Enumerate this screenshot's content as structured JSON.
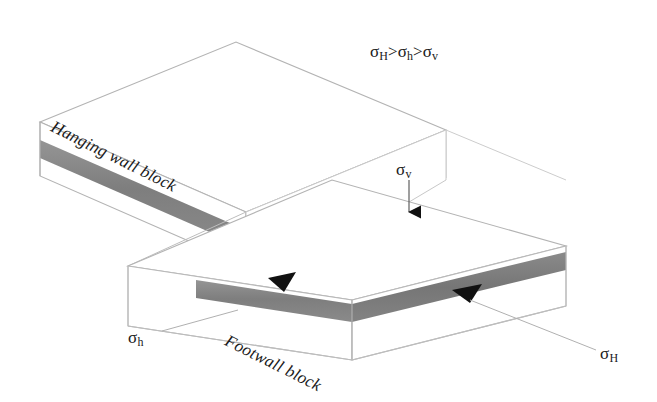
{
  "figure": {
    "type": "geological-block-diagram"
  },
  "labels": {
    "hanging_wall": "Hanging wall block",
    "footwall": "Footwall block",
    "stress_inequality": {
      "sigma1": "σ",
      "sigma1_sub": "H",
      "op1": ">",
      "sigma2": "σ",
      "sigma2_sub": "h",
      "op2": ">",
      "sigma3": "σ",
      "sigma3_sub": "v"
    },
    "sigma_v": {
      "symbol": "σ",
      "subscript": "v"
    },
    "sigma_h": {
      "symbol": "σ",
      "subscript": "h"
    },
    "sigma_H": {
      "symbol": "σ",
      "subscript": "H"
    }
  },
  "colors": {
    "marker_bed": "#808080",
    "marker_bed_shaded": "#8d8d8d",
    "marker_bed_dark": "#6f6f6f",
    "outline": "#b9b9b9",
    "outline_strong": "#9a9a9a",
    "arrow": "#111111",
    "leader": "#a8a8a8",
    "text": "#1a1a1a",
    "face": "#ffffff"
  },
  "geometry": {
    "hanging_wall_block": {
      "top_face": "40,122 236,42 446,130 246,212",
      "front_face": "40,122 246,212 246,262 40,172",
      "right_face": "246,212 446,130 446,180 246,262"
    },
    "footwall_block": {
      "top_face": "128,318 332,232 566,300 352,352",
      "front_face": "128,318 352,352 352,300 128,266",
      "right_face": "352,352 566,300 566,246 352,300"
    },
    "marker_bed": {
      "hanging_wall_front": "40,148 246,238 246,254 40,164",
      "footwall_front": "196,282 352,338 352,354 196,298",
      "footwall_right": "352,338 566,286 566,302 352,354"
    }
  },
  "annotations": {
    "sigma_v_arrow": {
      "from": [
        408,
        178
      ],
      "to": [
        408,
        224
      ],
      "style": "solid-triangle-down"
    },
    "shear_arrow_left": {
      "at": [
        282,
        282
      ],
      "direction": "down-left"
    },
    "shear_arrow_right": {
      "at": [
        466,
        292
      ],
      "direction": "down-left"
    },
    "sigma_h_leader": {
      "from": [
        160,
        330
      ],
      "to": [
        232,
        312
      ]
    },
    "sigma_H_leader": {
      "from": [
        596,
        352
      ],
      "to": [
        470,
        300
      ]
    }
  }
}
